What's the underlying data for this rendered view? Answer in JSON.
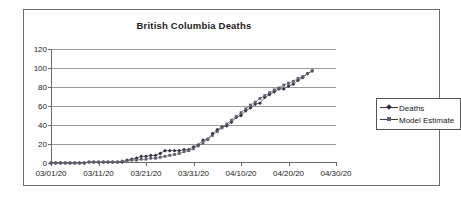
{
  "chart_data": {
    "type": "line",
    "title": "British Columbia Deaths",
    "xlabel": "",
    "ylabel": "",
    "ylim": [
      0,
      120
    ],
    "yticks": [
      0,
      20,
      40,
      60,
      80,
      100,
      120
    ],
    "xticks": [
      "03/01/20",
      "03/11/20",
      "03/21/20",
      "03/31/20",
      "04/10/20",
      "04/20/20",
      "04/30/20"
    ],
    "x_start": "03/01/20",
    "x_end": "04/30/20",
    "grid": "horizontal",
    "legend_position": "right",
    "series": [
      {
        "name": "Deaths",
        "marker": "diamond",
        "color": "#2e2e3d",
        "x": [
          "03/01/20",
          "03/02/20",
          "03/03/20",
          "03/04/20",
          "03/05/20",
          "03/06/20",
          "03/07/20",
          "03/08/20",
          "03/09/20",
          "03/10/20",
          "03/11/20",
          "03/12/20",
          "03/13/20",
          "03/14/20",
          "03/15/20",
          "03/16/20",
          "03/17/20",
          "03/18/20",
          "03/19/20",
          "03/20/20",
          "03/21/20",
          "03/22/20",
          "03/23/20",
          "03/24/20",
          "03/25/20",
          "03/26/20",
          "03/27/20",
          "03/28/20",
          "03/29/20",
          "03/30/20",
          "03/31/20",
          "04/01/20",
          "04/02/20",
          "04/03/20",
          "04/04/20",
          "04/05/20",
          "04/06/20",
          "04/07/20",
          "04/08/20",
          "04/09/20",
          "04/10/20",
          "04/11/20",
          "04/12/20",
          "04/13/20",
          "04/14/20",
          "04/15/20",
          "04/16/20",
          "04/17/20",
          "04/18/20",
          "04/19/20",
          "04/20/20",
          "04/21/20",
          "04/22/20",
          "04/23/20",
          "04/24/20",
          "04/25/20"
        ],
        "values": [
          0,
          0,
          0,
          0,
          0,
          0,
          0,
          0,
          1,
          1,
          1,
          1,
          1,
          1,
          1,
          1,
          3,
          4,
          5,
          7,
          7,
          8,
          8,
          10,
          13,
          13,
          13,
          13,
          14,
          14,
          17,
          19,
          24,
          25,
          31,
          35,
          38,
          39,
          43,
          48,
          50,
          55,
          58,
          62,
          63,
          69,
          72,
          75,
          78,
          78,
          81,
          83,
          87,
          90,
          94,
          97
        ]
      },
      {
        "name": "Model Estimate",
        "marker": "square",
        "color": "#5f5f6e",
        "x": [
          "03/01/20",
          "03/02/20",
          "03/03/20",
          "03/04/20",
          "03/05/20",
          "03/06/20",
          "03/07/20",
          "03/08/20",
          "03/09/20",
          "03/10/20",
          "03/11/20",
          "03/12/20",
          "03/13/20",
          "03/14/20",
          "03/15/20",
          "03/16/20",
          "03/17/20",
          "03/18/20",
          "03/19/20",
          "03/20/20",
          "03/21/20",
          "03/22/20",
          "03/23/20",
          "03/24/20",
          "03/25/20",
          "03/26/20",
          "03/27/20",
          "03/28/20",
          "03/29/20",
          "03/30/20",
          "03/31/20",
          "04/01/20",
          "04/02/20",
          "04/03/20",
          "04/04/20",
          "04/05/20",
          "04/06/20",
          "04/07/20",
          "04/08/20",
          "04/09/20",
          "04/10/20",
          "04/11/20",
          "04/12/20",
          "04/13/20",
          "04/14/20",
          "04/15/20",
          "04/16/20",
          "04/17/20",
          "04/18/20",
          "04/19/20",
          "04/20/20",
          "04/21/20",
          "04/22/20",
          "04/23/20",
          "04/24/20",
          "04/25/20"
        ],
        "values": [
          0,
          0,
          0,
          0,
          0,
          0,
          0,
          0,
          1,
          1,
          1,
          1,
          1,
          1,
          1,
          2,
          2,
          3,
          3,
          4,
          4,
          5,
          5,
          6,
          7,
          8,
          9,
          10,
          12,
          13,
          15,
          18,
          21,
          25,
          29,
          33,
          37,
          41,
          45,
          49,
          53,
          57,
          61,
          64,
          68,
          71,
          74,
          77,
          79,
          82,
          84,
          86,
          89,
          91,
          94,
          97
        ]
      }
    ]
  },
  "legend": {
    "entries": [
      {
        "label": "Deaths"
      },
      {
        "label": "Model Estimate"
      }
    ]
  }
}
